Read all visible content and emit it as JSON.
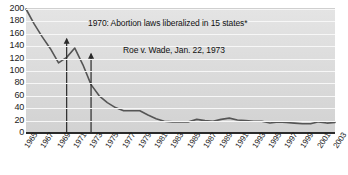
{
  "chart_data": {
    "type": "line",
    "title": "",
    "subtitle": "",
    "xlabel": "",
    "ylabel": "",
    "xlim": [
      1965,
      2003
    ],
    "ylim": [
      0,
      200
    ],
    "grid": true,
    "legend": null,
    "y_ticks": [
      200,
      180,
      160,
      140,
      120,
      100,
      80,
      60,
      40,
      20,
      0
    ],
    "x_ticks": [
      "1965",
      "1967",
      "1969",
      "1971",
      "1973",
      "1975",
      "1977",
      "1979",
      "1981",
      "1983",
      "1985",
      "1987",
      "1989",
      "1991",
      "1993",
      "1995",
      "1997",
      "1999",
      "2001",
      "2003"
    ],
    "series": [
      {
        "name": "rate",
        "color": "#555555",
        "x": [
          1965,
          1966,
          1967,
          1968,
          1969,
          1970,
          1971,
          1972,
          1973,
          1974,
          1975,
          1976,
          1977,
          1978,
          1979,
          1980,
          1981,
          1982,
          1983,
          1984,
          1985,
          1986,
          1987,
          1988,
          1989,
          1990,
          1991,
          1992,
          1993,
          1994,
          1995,
          1996,
          1997,
          1998,
          1999,
          2000,
          2001,
          2002,
          2003
        ],
        "y": [
          200,
          176,
          155,
          136,
          113,
          122,
          137,
          110,
          78,
          60,
          49,
          41,
          36,
          36,
          36,
          29,
          23,
          19,
          18,
          18,
          18,
          22,
          20,
          19,
          22,
          24,
          21,
          20,
          19,
          19,
          16,
          18,
          17,
          16,
          15,
          15,
          18,
          16,
          17
        ]
      }
    ],
    "annotations": [
      {
        "id": "liberalization",
        "text": "1970: Abortion laws liberalized in 15 states*",
        "arrow_year": 1970,
        "arrow_top_value": 152,
        "arrow_bottom_value": 0
      },
      {
        "id": "roe-v-wade",
        "text": "Roe v. Wade, Jan. 22, 1973",
        "arrow_year": 1973,
        "arrow_top_value": 128,
        "arrow_bottom_value": 0
      }
    ],
    "colors": {
      "line": "#555555",
      "plot_background": "#dcdcdc",
      "gridline": "#f7f7f7",
      "axis": "#2a2a2a",
      "text": "#1a1a1a"
    }
  }
}
